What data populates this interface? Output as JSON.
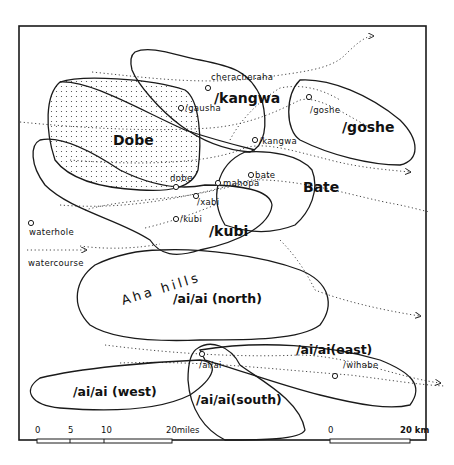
{
  "map": {
    "territories": {
      "dobe": "Dobe",
      "kangwa": "/kangwa",
      "goshe": "/goshe",
      "bate": "Bate",
      "kubi": "/kubi",
      "aiai_north": "/ai/ai (north)",
      "aiai_east": "/ai/ai(east)",
      "aiai_west": "/ai/ai (west)",
      "aiai_south": "/ai/ai(south)"
    },
    "waterholes": {
      "cheracheraha": "cheracheraha",
      "gausha": "/gausha",
      "kangwa": "/kangwa",
      "goshe": "/goshe",
      "dobe": "dobe",
      "xabi": "/xabi",
      "mahopa": "mahopa",
      "bate": "bate",
      "kubi": "/kubi",
      "aiai": "/ai/ai",
      "wihabe": "/wihabe"
    },
    "features": {
      "hills": "Aha hills"
    },
    "legend": {
      "waterhole_label": "waterhole",
      "waterhole_icon": "circle-icon",
      "watercourse_label": "watercourse",
      "watercourse_icon": "dotted-arrow-icon"
    },
    "scales": {
      "miles": {
        "ticks": [
          "0",
          "5",
          "10"
        ],
        "end_label": "20miles"
      },
      "km": {
        "start_label": "0",
        "end_label": "20 km"
      }
    }
  }
}
